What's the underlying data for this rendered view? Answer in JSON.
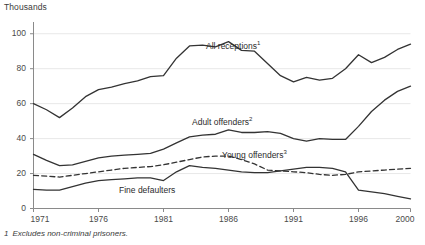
{
  "chart_data": {
    "type": "line",
    "title": "",
    "ylabel": "Thousands",
    "xlabel": "",
    "ylim": [
      0,
      105
    ],
    "xlim": [
      1971,
      2000
    ],
    "grid": true,
    "grid_axis": "y",
    "legend_position": "inline-annotations",
    "yticks": [
      0,
      20,
      40,
      60,
      80,
      100
    ],
    "ytick_labels": [
      "0",
      "20",
      "40",
      "60",
      "80",
      "100"
    ],
    "xticks": [
      1971,
      1976,
      1981,
      1986,
      1991,
      1996,
      2000
    ],
    "xtick_labels": [
      "1971",
      "1976",
      "1981",
      "1986",
      "1991",
      "1996",
      "2000"
    ],
    "x": [
      1971,
      1972,
      1973,
      1974,
      1975,
      1976,
      1977,
      1978,
      1979,
      1980,
      1981,
      1982,
      1983,
      1984,
      1985,
      1986,
      1987,
      1988,
      1989,
      1990,
      1991,
      1992,
      1993,
      1994,
      1995,
      1996,
      1997,
      1998,
      1999,
      2000
    ],
    "series": [
      {
        "name": "All receptions",
        "footnote_marker": "1",
        "style": "solid",
        "color": "#333333",
        "label_text": "All receptions",
        "values": [
          60.0,
          56.5,
          52.0,
          57.5,
          64.0,
          68.0,
          69.5,
          71.5,
          73.0,
          75.5,
          76.0,
          86.0,
          93.0,
          93.5,
          92.5,
          95.5,
          90.5,
          90.0,
          83.0,
          76.0,
          72.5,
          75.0,
          73.5,
          74.5,
          80.0,
          88.0,
          83.5,
          86.5,
          91.0,
          94.0
        ]
      },
      {
        "name": "Adult offenders",
        "footnote_marker": "2",
        "style": "solid",
        "color": "#333333",
        "label_text": "Adult offenders",
        "values": [
          31.0,
          27.5,
          24.5,
          25.0,
          27.0,
          29.0,
          30.0,
          30.5,
          31.0,
          31.5,
          34.0,
          37.5,
          41.0,
          42.0,
          42.5,
          45.0,
          43.5,
          43.5,
          44.0,
          43.0,
          40.0,
          38.5,
          40.0,
          39.5,
          39.5,
          47.0,
          55.5,
          62.0,
          67.0,
          70.0
        ]
      },
      {
        "name": "Young offenders",
        "footnote_marker": "3",
        "style": "dashed",
        "color": "#333333",
        "label_text": "Young offenders",
        "values": [
          19.0,
          18.5,
          18.0,
          19.0,
          20.0,
          21.0,
          22.0,
          23.0,
          23.5,
          24.0,
          25.0,
          26.5,
          28.0,
          29.5,
          30.0,
          30.0,
          28.0,
          25.5,
          22.0,
          21.5,
          21.0,
          20.5,
          19.5,
          19.0,
          19.5,
          21.0,
          21.5,
          22.0,
          22.5,
          23.0
        ]
      },
      {
        "name": "Fine defaulters",
        "footnote_marker": "",
        "style": "solid",
        "color": "#333333",
        "label_text": "Fine defaulters",
        "values": [
          11.0,
          10.5,
          10.5,
          12.5,
          14.5,
          16.0,
          16.5,
          17.0,
          17.5,
          17.5,
          16.0,
          21.0,
          24.5,
          23.5,
          23.0,
          22.0,
          21.0,
          20.5,
          20.5,
          21.5,
          22.5,
          23.5,
          23.5,
          23.0,
          21.0,
          10.5,
          9.5,
          8.5,
          7.0,
          5.5
        ]
      }
    ],
    "annotations": [
      {
        "text": "All receptions",
        "marker": "1",
        "x_px": 206,
        "y_px": 41
      },
      {
        "text": "Adult offenders",
        "marker": "2",
        "x_px": 192,
        "y_px": 117
      },
      {
        "text": "Young offenders",
        "marker": "3",
        "x_px": 222,
        "y_px": 150
      },
      {
        "text": "Fine defaulters",
        "marker": "",
        "x_px": 119,
        "y_px": 185
      }
    ]
  },
  "footnote": {
    "number": "1",
    "text": "Excludes non-criminal prisoners."
  },
  "colors": {
    "line": "#333333",
    "axis": "#8a8a8a",
    "grid": "#e8e8e8",
    "text": "#3a3a3a"
  }
}
